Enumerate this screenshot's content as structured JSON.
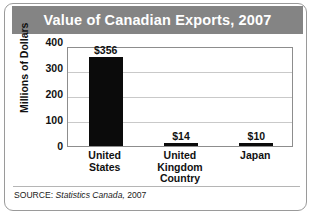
{
  "figure": {
    "title": "Value of Canadian Exports, 2007",
    "source_prefix": "SOURCE:",
    "source_publisher": "Statistics Canada,",
    "source_year": "2007",
    "colors": {
      "banner": "#848484",
      "banner_text": "#ffffff",
      "bar": "#0b0b0b",
      "gridline": "#c9c9c9",
      "plot_border": "#8d8d8d",
      "card_border": "#9a9a9a",
      "text": "#111111"
    }
  },
  "chart_data": {
    "type": "bar",
    "title": "Value of Canadian Exports, 2007",
    "xlabel": "Country",
    "ylabel": "Millions of Dollars",
    "categories": [
      "United States",
      "United Kingdom",
      "Japan"
    ],
    "category_lines": [
      [
        "United",
        "States"
      ],
      [
        "United",
        "Kingdom"
      ],
      [
        "Japan"
      ]
    ],
    "values": [
      356,
      14,
      10
    ],
    "value_labels": [
      "$356",
      "$14",
      "$10"
    ],
    "ylim": [
      0,
      400
    ],
    "yticks": [
      400,
      300,
      200,
      100,
      0
    ],
    "ytick_labels": [
      "400",
      "300",
      "200",
      "100",
      "0"
    ],
    "grid": true,
    "legend": false
  }
}
